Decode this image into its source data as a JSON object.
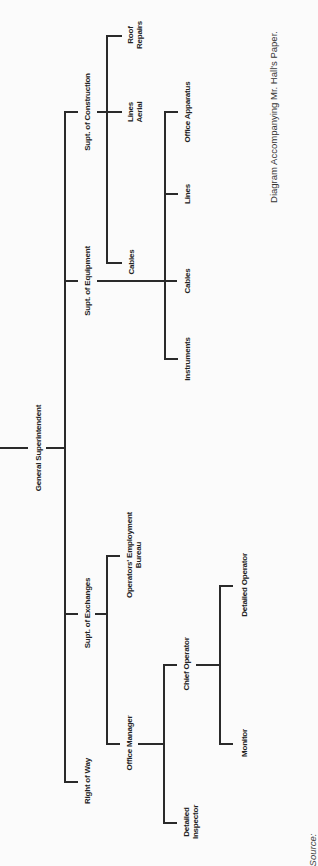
{
  "caption": "Diagram Accompanying Mr. Hall's Paper.",
  "source_label": "Source:",
  "org_chart": {
    "root": {
      "label": "General Superintendent",
      "children": [
        {
          "label": "Supt. of Construction",
          "children": [
            {
              "label": "Cables"
            },
            {
              "label_line1": "Lines",
              "label_line2": "Aerial"
            },
            {
              "label_line1": "Roof",
              "label_line2": "Repairs"
            }
          ]
        },
        {
          "label": "Supt. of Equipment",
          "children": [
            {
              "label": "Instruments"
            },
            {
              "label": "Cables"
            },
            {
              "label": "Lines"
            },
            {
              "label": "Office Apparatus"
            }
          ]
        },
        {
          "label": "Supt. of Exchanges",
          "children": [
            {
              "label": "Office Manager",
              "children": [
                {
                  "label_line1": "Detailed",
                  "label_line2": "Inspector"
                },
                {
                  "label": "Chief Operator",
                  "children": [
                    {
                      "label": "Monitor"
                    },
                    {
                      "label": "Detailed Operator"
                    }
                  ]
                }
              ]
            },
            {
              "label_line1": "Operators' Employment",
              "label_line2": "Bureau"
            }
          ]
        },
        {
          "label": "Right of Way"
        }
      ]
    }
  },
  "colors": {
    "background": "#fbfbfb",
    "line": "#2a2a2a",
    "text": "#222222"
  }
}
